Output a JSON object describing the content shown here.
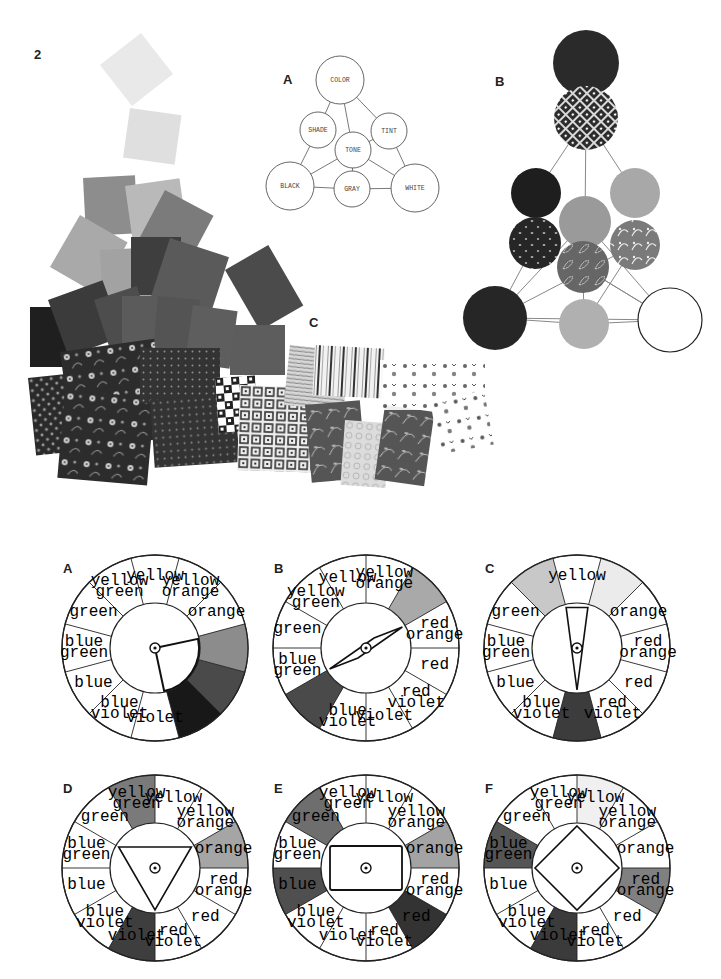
{
  "page": {
    "plate_number": "2"
  },
  "top_figures": {
    "A": {
      "label": "A",
      "title": "color-tone relationship diagram",
      "nodes": [
        {
          "id": "color",
          "text": "COLOR",
          "cx": 340,
          "cy": 80,
          "r": 24
        },
        {
          "id": "shade",
          "text": "SHADE",
          "cx": 318,
          "cy": 130,
          "r": 18
        },
        {
          "id": "tint",
          "text": "TINT",
          "cx": 389,
          "cy": 131,
          "r": 18
        },
        {
          "id": "tone",
          "text": "TONE",
          "cx": 353,
          "cy": 150,
          "r": 18
        },
        {
          "id": "black",
          "text": "BLACK",
          "cx": 290,
          "cy": 186,
          "r": 24
        },
        {
          "id": "gray",
          "text": "GRAY",
          "cx": 352,
          "cy": 189,
          "r": 18
        },
        {
          "id": "white",
          "text": "WHITE",
          "cx": 415,
          "cy": 188,
          "r": 24
        }
      ],
      "edges": [
        [
          "color",
          "shade"
        ],
        [
          "color",
          "tint"
        ],
        [
          "color",
          "tone"
        ],
        [
          "shade",
          "black"
        ],
        [
          "tint",
          "white"
        ],
        [
          "tone",
          "black"
        ],
        [
          "tone",
          "white"
        ],
        [
          "tone",
          "gray"
        ],
        [
          "tone",
          "tint"
        ],
        [
          "black",
          "gray"
        ],
        [
          "gray",
          "white"
        ]
      ]
    },
    "B": {
      "label": "B",
      "title": "fabric swatch tone triangle",
      "circles": [
        {
          "cx": 586,
          "cy": 63,
          "r": 33,
          "fill": "#2a2a2a",
          "pattern": "solid"
        },
        {
          "cx": 586,
          "cy": 118,
          "r": 32,
          "fill": "#3a3a3a",
          "pattern": "diamond"
        },
        {
          "cx": 536,
          "cy": 193,
          "r": 25,
          "fill": "#1e1e1e",
          "pattern": "solid"
        },
        {
          "cx": 635,
          "cy": 193,
          "r": 25,
          "fill": "#a8a8a8",
          "pattern": "solid"
        },
        {
          "cx": 585,
          "cy": 222,
          "r": 26,
          "fill": "#9a9a9a",
          "pattern": "solid"
        },
        {
          "cx": 535,
          "cy": 243,
          "r": 26,
          "fill": "#262626",
          "pattern": "dots"
        },
        {
          "cx": 635,
          "cy": 245,
          "r": 25,
          "fill": "#7a7a7a",
          "pattern": "floral"
        },
        {
          "cx": 583,
          "cy": 267,
          "r": 26,
          "fill": "#6a6a6a",
          "pattern": "leaves"
        },
        {
          "cx": 495,
          "cy": 318,
          "r": 32,
          "fill": "#262626",
          "pattern": "solid"
        },
        {
          "cx": 584,
          "cy": 324,
          "r": 25,
          "fill": "#b0b0b0",
          "pattern": "solid"
        },
        {
          "cx": 670,
          "cy": 320,
          "r": 32,
          "fill": "#ffffff",
          "pattern": "outline"
        }
      ]
    },
    "C": {
      "label": "C",
      "title": "fabric swatch collage"
    }
  },
  "wheels_section": {
    "segment_labels": [
      [
        "yellow"
      ],
      [
        "yellow",
        "orange"
      ],
      [
        "orange"
      ],
      [
        "red",
        "orange"
      ],
      [
        "red"
      ],
      [
        "red",
        "violet"
      ],
      [
        "violet"
      ],
      [
        "blue",
        "violet"
      ],
      [
        "blue"
      ],
      [
        "blue",
        "green"
      ],
      [
        "green"
      ],
      [
        "yellow",
        "green"
      ]
    ],
    "wheels": [
      {
        "label": "A",
        "scheme": "analogous",
        "cx": 155,
        "cy": 648,
        "r": 93,
        "inner_r": 45,
        "shaded": {
          "2": "#ffffff",
          "3": "#8c8c8c",
          "4": "#4a4a4a",
          "5": "#181818"
        },
        "hidden_labels": [
          3,
          4,
          5
        ],
        "pointer": "wedge"
      },
      {
        "label": "B",
        "scheme": "complementary",
        "cx": 366,
        "cy": 648,
        "r": 93,
        "inner_r": 45,
        "shaded": {
          "2": "#a9a9a9",
          "8": "#4a4a4a"
        },
        "hidden_labels": [
          2,
          8
        ],
        "shade_offset": -0.5,
        "pointer": "rhombus"
      },
      {
        "label": "C",
        "scheme": "split-complementary",
        "cx": 577,
        "cy": 648,
        "r": 93,
        "inner_r": 45,
        "shaded": {
          "11": "#c8c8c8",
          "1": "#ebebeb",
          "6": "#3c3c3c"
        },
        "hidden_labels": [
          11,
          1,
          6
        ],
        "pointer": "narrow-triangle"
      },
      {
        "label": "D",
        "scheme": "triad",
        "cx": 155,
        "cy": 868,
        "r": 93,
        "inner_r": 45,
        "shaded": {
          "11": "#7a7a7a",
          "2": "#a5a5a5",
          "6": "#3e3e3e"
        },
        "hidden_labels": [],
        "shade_offset": 0.5,
        "pointer": "triangle-down"
      },
      {
        "label": "E",
        "scheme": "double-complementary",
        "cx": 366,
        "cy": 868,
        "r": 93,
        "inner_r": 45,
        "shaded": {
          "2": "#a3a3a3",
          "4": "#333333",
          "8": "#4f4f4f",
          "10": "#6e6e6e"
        },
        "hidden_labels": [],
        "shade_offset": 0.5,
        "pointer": "rectangle"
      },
      {
        "label": "F",
        "scheme": "tetrad",
        "cx": 577,
        "cy": 868,
        "r": 93,
        "inner_r": 45,
        "shaded": {
          "0": "#f0f0f0",
          "3": "#808080",
          "6": "#3b3b3b",
          "9": "#555555"
        },
        "hidden_labels": [],
        "shade_offset": 0.5,
        "pointer": "square"
      }
    ]
  }
}
